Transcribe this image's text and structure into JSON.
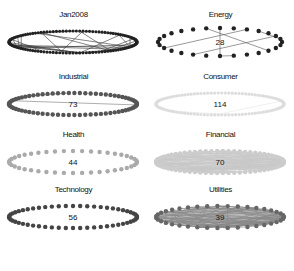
{
  "figure": {
    "panels": [
      {
        "id": "jan2008",
        "title": "Jan2008",
        "count": "",
        "node_color": "#222222",
        "edge_color": "#333333",
        "style": "dense-ring",
        "nodes": 120,
        "edges": 30
      },
      {
        "id": "energy",
        "title": "Energy",
        "count": "28",
        "node_color": "#222222",
        "edge_color": "#555555",
        "style": "sparse-dots",
        "nodes": 28,
        "edges": 8
      },
      {
        "id": "industrial",
        "title": "Industrial",
        "count": "73",
        "node_color": "#555555",
        "edge_color": "#777777",
        "style": "ring",
        "nodes": 73,
        "edges": 3
      },
      {
        "id": "consumer",
        "title": "Consumer",
        "count": "114",
        "node_color": "#dddddd",
        "edge_color": "#e5e5e5",
        "style": "ring",
        "nodes": 114,
        "edges": 4
      },
      {
        "id": "health",
        "title": "Health",
        "count": "44",
        "node_color": "#aaaaaa",
        "edge_color": "#bbbbbb",
        "style": "ring",
        "nodes": 44,
        "edges": 0
      },
      {
        "id": "financial",
        "title": "Financial",
        "count": "70",
        "node_color": "#cccccc",
        "edge_color": "#c8c8c8",
        "style": "filled",
        "nodes": 70,
        "edges": 120
      },
      {
        "id": "technology",
        "title": "Technology",
        "count": "56",
        "node_color": "#444444",
        "edge_color": "#666666",
        "style": "ring",
        "nodes": 56,
        "edges": 0
      },
      {
        "id": "utilities",
        "title": "Utilities",
        "count": "39",
        "node_color": "#666666",
        "edge_color": "#888888",
        "style": "filled",
        "nodes": 39,
        "edges": 90
      }
    ]
  }
}
